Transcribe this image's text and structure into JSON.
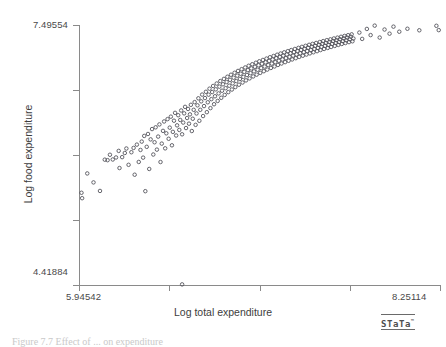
{
  "figure": {
    "caption": "Figure 7.7  Effect of ... on expenditure",
    "brand": "STaTa",
    "brand_mark": "™"
  },
  "chart_data": {
    "type": "scatter",
    "title": "",
    "xlabel": "Log total expenditure",
    "ylabel": "Log food expenditure",
    "xlim": [
      5.94542,
      8.25114
    ],
    "ylim": [
      4.41884,
      7.49554
    ],
    "xticks": [
      5.94542,
      6.52185,
      7.09828,
      7.67471,
      8.25114
    ],
    "yticks": [
      4.41884,
      5.18802,
      5.95719,
      6.72637,
      7.49554
    ],
    "xtick_labels": [
      "5.94542",
      "",
      "",
      "",
      "8.25114"
    ],
    "ytick_labels": [
      "4.41884",
      "",
      "",
      "",
      "7.49554"
    ],
    "grid": false,
    "legend": null,
    "marker": "open-circle",
    "marker_color": "#55555c",
    "n_points": 251,
    "points": [
      [
        5.9612,
        5.5102
      ],
      [
        5.9655,
        5.4461
      ],
      [
        5.9982,
        5.739
      ],
      [
        6.0381,
        5.633
      ],
      [
        6.0795,
        5.532
      ],
      [
        6.1101,
        5.902
      ],
      [
        6.128,
        5.896
      ],
      [
        6.143,
        5.96
      ],
      [
        6.161,
        5.904
      ],
      [
        6.182,
        5.928
      ],
      [
        6.199,
        6.006
      ],
      [
        6.204,
        5.803
      ],
      [
        6.221,
        5.932
      ],
      [
        6.238,
        5.981
      ],
      [
        6.248,
        6.034
      ],
      [
        6.262,
        5.841
      ],
      [
        6.28,
        5.99
      ],
      [
        6.294,
        6.041
      ],
      [
        6.301,
        5.724
      ],
      [
        6.315,
        6.08
      ],
      [
        6.327,
        5.875
      ],
      [
        6.338,
        6.017
      ],
      [
        6.346,
        6.116
      ],
      [
        6.355,
        5.926
      ],
      [
        6.362,
        6.183
      ],
      [
        6.369,
        5.529
      ],
      [
        6.378,
        6.054
      ],
      [
        6.386,
        6.206
      ],
      [
        6.394,
        5.792
      ],
      [
        6.403,
        6.142
      ],
      [
        6.412,
        6.264
      ],
      [
        6.42,
        5.963
      ],
      [
        6.428,
        6.108
      ],
      [
        6.435,
        6.285
      ],
      [
        6.443,
        6.021
      ],
      [
        6.451,
        6.175
      ],
      [
        6.459,
        6.319
      ],
      [
        6.466,
        5.874
      ],
      [
        6.474,
        6.092
      ],
      [
        6.482,
        6.243
      ],
      [
        6.489,
        6.354
      ],
      [
        6.496,
        6.036
      ],
      [
        6.503,
        6.214
      ],
      [
        6.511,
        6.382
      ],
      [
        6.518,
        6.149
      ],
      [
        6.525,
        6.281
      ],
      [
        6.532,
        6.411
      ],
      [
        6.539,
        6.072
      ],
      [
        6.545,
        6.231
      ],
      [
        6.552,
        6.363
      ],
      [
        6.559,
        6.456
      ],
      [
        6.566,
        6.188
      ],
      [
        6.572,
        6.308
      ],
      [
        6.579,
        6.428
      ],
      [
        6.586,
        6.254
      ],
      [
        6.592,
        6.372
      ],
      [
        6.598,
        6.484
      ],
      [
        6.604,
        6.202
      ],
      [
        6.611,
        6.341
      ],
      [
        6.617,
        6.45
      ],
      [
        6.623,
        6.527
      ],
      [
        6.629,
        6.276
      ],
      [
        6.636,
        6.395
      ],
      [
        6.642,
        6.502
      ],
      [
        6.648,
        6.328
      ],
      [
        6.654,
        6.438
      ],
      [
        6.66,
        6.551
      ],
      [
        6.666,
        6.241
      ],
      [
        6.672,
        6.386
      ],
      [
        6.678,
        6.492
      ],
      [
        6.684,
        6.583
      ],
      [
        6.69,
        6.314
      ],
      [
        6.696,
        6.449
      ],
      [
        6.702,
        6.545
      ],
      [
        6.708,
        6.628
      ],
      [
        6.714,
        6.362
      ],
      [
        6.72,
        6.492
      ],
      [
        6.726,
        6.592
      ],
      [
        6.732,
        6.672
      ],
      [
        6.738,
        6.418
      ],
      [
        6.744,
        6.536
      ],
      [
        6.75,
        6.631
      ],
      [
        6.756,
        6.705
      ],
      [
        6.762,
        6.464
      ],
      [
        6.768,
        6.581
      ],
      [
        6.773,
        6.671
      ],
      [
        6.779,
        6.742
      ],
      [
        6.785,
        6.512
      ],
      [
        6.791,
        6.618
      ],
      [
        6.796,
        6.702
      ],
      [
        6.802,
        6.774
      ],
      [
        6.808,
        6.558
      ],
      [
        6.814,
        6.652
      ],
      [
        6.819,
        6.734
      ],
      [
        6.825,
        6.803
      ],
      [
        6.831,
        6.597
      ],
      [
        6.837,
        6.686
      ],
      [
        6.842,
        6.766
      ],
      [
        6.848,
        6.832
      ],
      [
        6.854,
        6.634
      ],
      [
        6.859,
        6.718
      ],
      [
        6.865,
        6.794
      ],
      [
        6.871,
        6.858
      ],
      [
        6.876,
        6.668
      ],
      [
        6.882,
        6.748
      ],
      [
        6.888,
        6.821
      ],
      [
        6.893,
        6.883
      ],
      [
        6.899,
        6.701
      ],
      [
        6.905,
        6.777
      ],
      [
        6.91,
        6.847
      ],
      [
        6.916,
        6.907
      ],
      [
        6.922,
        6.732
      ],
      [
        6.927,
        6.805
      ],
      [
        6.933,
        6.872
      ],
      [
        6.939,
        6.93
      ],
      [
        6.944,
        6.761
      ],
      [
        6.95,
        6.832
      ],
      [
        6.956,
        6.896
      ],
      [
        6.961,
        6.952
      ],
      [
        6.967,
        6.789
      ],
      [
        6.973,
        6.857
      ],
      [
        6.978,
        6.919
      ],
      [
        6.984,
        6.973
      ],
      [
        6.99,
        6.815
      ],
      [
        6.995,
        6.881
      ],
      [
        7.001,
        6.941
      ],
      [
        7.007,
        6.993
      ],
      [
        7.012,
        6.84
      ],
      [
        7.018,
        6.904
      ],
      [
        7.024,
        6.962
      ],
      [
        7.029,
        7.013
      ],
      [
        7.035,
        6.864
      ],
      [
        7.041,
        6.926
      ],
      [
        7.046,
        6.982
      ],
      [
        7.052,
        7.031
      ],
      [
        7.058,
        6.887
      ],
      [
        7.063,
        6.947
      ],
      [
        7.069,
        7.001
      ],
      [
        7.075,
        7.049
      ],
      [
        7.08,
        6.908
      ],
      [
        7.086,
        6.966
      ],
      [
        7.092,
        7.019
      ],
      [
        7.097,
        7.066
      ],
      [
        7.103,
        6.929
      ],
      [
        7.109,
        6.985
      ],
      [
        7.114,
        7.037
      ],
      [
        7.12,
        7.082
      ],
      [
        7.126,
        6.949
      ],
      [
        7.131,
        7.004
      ],
      [
        7.137,
        7.054
      ],
      [
        7.143,
        7.098
      ],
      [
        7.148,
        6.968
      ],
      [
        7.154,
        7.022
      ],
      [
        7.16,
        7.071
      ],
      [
        7.165,
        7.114
      ],
      [
        7.171,
        6.987
      ],
      [
        7.177,
        7.039
      ],
      [
        7.182,
        7.087
      ],
      [
        7.188,
        7.129
      ],
      [
        7.194,
        7.005
      ],
      [
        7.199,
        7.056
      ],
      [
        7.205,
        7.103
      ],
      [
        7.211,
        7.144
      ],
      [
        7.216,
        7.023
      ],
      [
        7.222,
        7.072
      ],
      [
        7.228,
        7.118
      ],
      [
        7.233,
        7.158
      ],
      [
        7.239,
        7.04
      ],
      [
        7.245,
        7.088
      ],
      [
        7.25,
        7.133
      ],
      [
        7.256,
        7.172
      ],
      [
        7.262,
        7.056
      ],
      [
        7.267,
        7.103
      ],
      [
        7.273,
        7.147
      ],
      [
        7.279,
        7.186
      ],
      [
        7.284,
        7.072
      ],
      [
        7.29,
        7.118
      ],
      [
        7.296,
        7.161
      ],
      [
        7.301,
        7.199
      ],
      [
        7.307,
        7.088
      ],
      [
        7.313,
        7.133
      ],
      [
        7.318,
        7.175
      ],
      [
        7.324,
        7.212
      ],
      [
        7.33,
        7.103
      ],
      [
        7.335,
        7.147
      ],
      [
        7.341,
        7.188
      ],
      [
        7.347,
        7.225
      ],
      [
        7.352,
        7.118
      ],
      [
        7.358,
        7.161
      ],
      [
        7.364,
        7.201
      ],
      [
        7.369,
        7.237
      ],
      [
        7.375,
        7.132
      ],
      [
        7.381,
        7.174
      ],
      [
        7.386,
        7.214
      ],
      [
        7.392,
        7.249
      ],
      [
        7.398,
        7.146
      ],
      [
        7.403,
        7.187
      ],
      [
        7.409,
        7.226
      ],
      [
        7.415,
        7.261
      ],
      [
        7.42,
        7.16
      ],
      [
        7.426,
        7.2
      ],
      [
        7.432,
        7.238
      ],
      [
        7.437,
        7.272
      ],
      [
        7.443,
        7.173
      ],
      [
        7.449,
        7.212
      ],
      [
        7.454,
        7.25
      ],
      [
        7.46,
        7.283
      ],
      [
        7.466,
        7.186
      ],
      [
        7.471,
        7.225
      ],
      [
        7.477,
        7.261
      ],
      [
        7.483,
        7.294
      ],
      [
        7.488,
        7.199
      ],
      [
        7.494,
        7.237
      ],
      [
        7.5,
        7.273
      ],
      [
        7.505,
        7.305
      ],
      [
        7.511,
        7.212
      ],
      [
        7.517,
        7.249
      ],
      [
        7.522,
        7.284
      ],
      [
        7.528,
        7.316
      ],
      [
        7.534,
        7.224
      ],
      [
        7.539,
        7.26
      ],
      [
        7.545,
        7.295
      ],
      [
        7.551,
        7.326
      ],
      [
        7.556,
        7.236
      ],
      [
        7.562,
        7.272
      ],
      [
        7.568,
        7.306
      ],
      [
        7.573,
        7.336
      ],
      [
        7.579,
        7.248
      ],
      [
        7.585,
        7.283
      ],
      [
        7.59,
        7.316
      ],
      [
        7.596,
        7.346
      ],
      [
        7.602,
        7.26
      ],
      [
        7.607,
        7.294
      ],
      [
        7.613,
        7.327
      ],
      [
        7.619,
        7.356
      ],
      [
        7.624,
        7.271
      ],
      [
        7.63,
        7.305
      ],
      [
        7.636,
        7.337
      ],
      [
        7.641,
        7.366
      ],
      [
        7.647,
        7.282
      ],
      [
        7.653,
        7.315
      ],
      [
        7.658,
        7.347
      ],
      [
        7.664,
        7.375
      ],
      [
        7.67,
        7.293
      ],
      [
        7.675,
        7.326
      ],
      [
        7.681,
        7.357
      ],
      [
        7.687,
        7.385
      ],
      [
        7.692,
        7.303
      ],
      [
        7.698,
        7.336
      ],
      [
        7.736,
        7.406
      ],
      [
        7.754,
        7.331
      ],
      [
        7.784,
        7.449
      ],
      [
        7.808,
        7.376
      ],
      [
        7.834,
        7.488
      ],
      [
        7.866,
        7.347
      ],
      [
        7.897,
        7.442
      ],
      [
        7.929,
        7.393
      ],
      [
        7.954,
        7.476
      ],
      [
        7.991,
        7.416
      ],
      [
        8.043,
        7.451
      ],
      [
        8.119,
        7.433
      ],
      [
        8.228,
        7.486
      ],
      [
        8.243,
        7.435
      ],
      [
        6.604,
        4.426
      ]
    ]
  }
}
